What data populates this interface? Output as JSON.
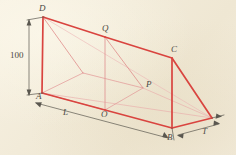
{
  "figure": {
    "type": "triangular-prism-geometry-diagram",
    "background_color": "#f3ecdb",
    "line_color": "#d94a4a",
    "thin_line_color": "#e08a8a",
    "dimension_color": "#57544d",
    "label_color": "#4c4a44"
  },
  "vertices": [
    {
      "id": "D",
      "label": "D",
      "x": 43,
      "y": 17,
      "label_x": 39,
      "label_y": 4
    },
    {
      "id": "Q",
      "label": "Q",
      "x": 105,
      "y": 37,
      "label_x": 102,
      "label_y": 24
    },
    {
      "id": "C",
      "label": "C",
      "x": 172,
      "y": 58,
      "label_x": 171,
      "label_y": 45
    },
    {
      "id": "A",
      "label": "A",
      "x": 42,
      "y": 93,
      "label_x": 38,
      "label_y": 93
    },
    {
      "id": "P",
      "label": "P",
      "x": 143,
      "y": 88,
      "label_x": 146,
      "label_y": 81
    },
    {
      "id": "O",
      "label": "O",
      "x": 105,
      "y": 110,
      "label_x": 101,
      "label_y": 110
    },
    {
      "id": "B",
      "label": "B",
      "x": 172,
      "y": 128,
      "label_x": 168,
      "label_y": 133
    },
    {
      "id": "T",
      "label": "T",
      "x": 212,
      "y": 118,
      "label_x": 203,
      "label_y": 128
    }
  ],
  "dimensions": [
    {
      "id": "height",
      "label": "100",
      "label_x": 11,
      "label_y": 51,
      "italic": false
    },
    {
      "id": "length",
      "label": "L",
      "label_x": 64,
      "label_y": 110,
      "italic": true
    },
    {
      "id": "thickness",
      "label": "T",
      "label_x": 203,
      "label_y": 128,
      "italic": true
    }
  ],
  "labels": {
    "height_value": "100",
    "length_symbol": "L",
    "thickness_symbol": "T",
    "vertex_D": "D",
    "vertex_Q": "Q",
    "vertex_C": "C",
    "vertex_A": "A",
    "vertex_P": "P",
    "vertex_O": "O",
    "vertex_B": "B",
    "vertex_T": "T"
  }
}
